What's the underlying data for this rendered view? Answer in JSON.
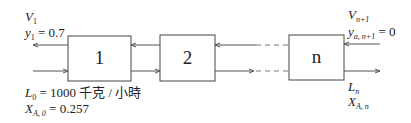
{
  "stages": [
    {
      "id": "stage-1",
      "label": "1"
    },
    {
      "id": "stage-2",
      "label": "2"
    },
    {
      "id": "stage-n",
      "label": "n"
    }
  ],
  "top_left": {
    "v_main": "V",
    "v_sub": "1",
    "y_main": "y",
    "y_sub": "1",
    "y_value": " = 0.7"
  },
  "bottom_left": {
    "l_main": "L",
    "l_sub": "0",
    "l_value": " = 1000 千克 / 小時",
    "x_main": "X",
    "x_sub": "A, 0",
    "x_value": " = 0.257"
  },
  "top_right": {
    "v_main": "V",
    "v_sub": "n+1",
    "y_main": "y",
    "y_sub": "a, n+1",
    "y_value": " = 0"
  },
  "bottom_right": {
    "l_main": "L",
    "l_sub": "n",
    "x_main": "X",
    "x_sub": "A, n"
  },
  "colors": {
    "line": "#555555",
    "dashed": "#777777",
    "box": "#444444"
  }
}
